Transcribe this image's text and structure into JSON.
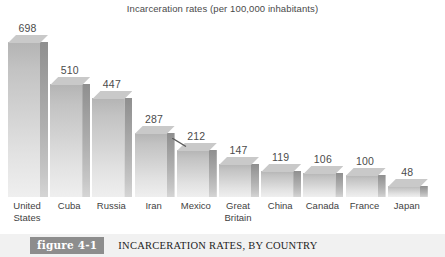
{
  "chart_data": {
    "type": "bar",
    "title": "Incarceration rates (per 100,000 inhabitants)",
    "xlabel": "",
    "ylabel": "",
    "ylim": [
      0,
      698
    ],
    "grid": false,
    "legend": "none",
    "categories": [
      "United States",
      "Cuba",
      "Russia",
      "Iran",
      "Mexico",
      "Great Britain",
      "China",
      "Canada",
      "France",
      "Japan"
    ],
    "category_lines": [
      [
        "United",
        "States"
      ],
      [
        "Cuba",
        ""
      ],
      [
        "Russia",
        ""
      ],
      [
        "Iran",
        ""
      ],
      [
        "Mexico",
        ""
      ],
      [
        "Great",
        "Britain"
      ],
      [
        "China",
        ""
      ],
      [
        "Canada",
        ""
      ],
      [
        "France",
        ""
      ],
      [
        "Japan",
        ""
      ]
    ],
    "values": [
      698,
      510,
      447,
      287,
      212,
      147,
      119,
      106,
      100,
      48
    ],
    "value_labels": [
      "698",
      "510",
      "447",
      "287",
      "212",
      "147",
      "119",
      "106",
      "100",
      "48"
    ],
    "style": "3d-bars-gray",
    "annotation": "leader-line-near-mexico-bar"
  },
  "caption": {
    "badge": "figure 4-1",
    "text": "INCARCERATION RATES, BY COUNTRY"
  },
  "colors": {
    "bar_front_top": "#b4b4b4",
    "bar_front_bottom": "#efefef",
    "bar_side": "#9e9e9e",
    "bar_top": "#c9c9c9",
    "caption_bar": "#f1f1f1",
    "badge": "#8d8d8d",
    "text": "#3a3a3a"
  }
}
